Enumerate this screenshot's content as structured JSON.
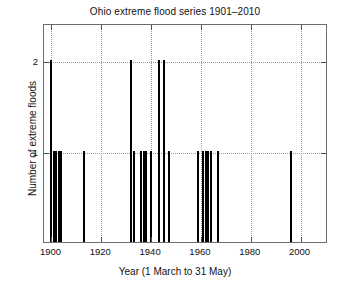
{
  "chart_data": {
    "type": "bar",
    "title": "Ohio extreme flood series 1901–2010",
    "xlabel": "Year (1 March to 31 May)",
    "ylabel": "Number of extreme floods",
    "xlim": [
      1897,
      2011
    ],
    "ylim": [
      0,
      2.4
    ],
    "grid": true,
    "legend": null,
    "xticks": [
      1900,
      1920,
      1940,
      1960,
      1980,
      2000
    ],
    "xtick_labels": [
      "1900",
      "1920",
      "1940",
      "1960",
      "1980",
      "2000"
    ],
    "yticks": [
      1,
      2
    ],
    "ytick_labels": [
      "1",
      "2"
    ],
    "series_name": "extreme floods per year",
    "bar_color": "#000000",
    "x": [
      1900,
      1901,
      1902,
      1903,
      1904,
      1913,
      1932,
      1933,
      1936,
      1937,
      1938,
      1940,
      1943,
      1945,
      1947,
      1959,
      1961,
      1962,
      1963,
      1964,
      1967,
      1996
    ],
    "values": [
      2,
      1,
      1,
      1,
      1,
      1,
      2,
      1,
      1,
      1,
      1,
      1,
      2,
      2,
      1,
      1,
      1,
      1,
      1,
      1,
      1,
      1
    ]
  },
  "axes": {
    "title": "Ohio extreme flood series 1901–2010",
    "xlabel": "Year (1 March to 31 May)",
    "ylabel": "Number of extreme floods"
  }
}
